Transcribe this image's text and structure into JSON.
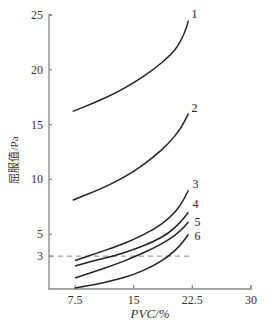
{
  "chart_data": {
    "type": "line",
    "title": "",
    "xlabel": "PVC/%",
    "ylabel": "屈服值/Pa",
    "xlim": [
      2.5,
      30
    ],
    "ylim": [
      0,
      25
    ],
    "x_ticks": [
      7.5,
      15,
      22.5,
      30
    ],
    "x_tick_labels": [
      "7.5",
      "15",
      "22.5",
      "30"
    ],
    "y_ticks": [
      3,
      5,
      10,
      15,
      20,
      25
    ],
    "y_tick_labels": [
      "3",
      "5",
      "10",
      "15",
      "20",
      "25"
    ],
    "grid": false,
    "legend": "inline curve numbers at right end of each curve",
    "reference_line": {
      "y": 3,
      "style": "dashed",
      "x_range": [
        2.5,
        22.5
      ]
    },
    "series": [
      {
        "name": "1",
        "x": [
          7.2,
          10,
          12.5,
          15,
          17.5,
          19.5,
          20.5,
          21.5,
          22.0
        ],
        "values": [
          16.2,
          17.0,
          17.8,
          18.8,
          20.0,
          21.2,
          22.0,
          23.3,
          24.5
        ]
      },
      {
        "name": "2",
        "x": [
          7.2,
          10,
          12.5,
          15,
          17.5,
          19.5,
          21.0,
          22.0
        ],
        "values": [
          8.1,
          8.9,
          9.7,
          10.7,
          12.0,
          13.3,
          14.6,
          16.0
        ]
      },
      {
        "name": "3",
        "x": [
          7.5,
          10,
          12.5,
          15,
          17.5,
          19.5,
          21.0,
          22.0
        ],
        "values": [
          2.6,
          3.2,
          3.8,
          4.5,
          5.4,
          6.4,
          7.6,
          9.0
        ]
      },
      {
        "name": "4",
        "x": [
          7.5,
          10,
          12.5,
          15,
          17.5,
          19.5,
          21.0,
          22.0
        ],
        "values": [
          2.1,
          2.6,
          3.0,
          3.6,
          4.3,
          5.1,
          6.1,
          7.0
        ]
      },
      {
        "name": "5",
        "x": [
          7.5,
          10,
          12.5,
          15,
          17.5,
          19.5,
          21.0,
          22.0
        ],
        "values": [
          1.0,
          1.6,
          2.2,
          2.9,
          3.7,
          4.5,
          5.3,
          6.1
        ]
      },
      {
        "name": "6",
        "x": [
          7.5,
          10,
          12.5,
          15,
          17.5,
          19.5,
          21.0,
          22.0
        ],
        "values": [
          0.1,
          0.4,
          0.8,
          1.3,
          2.1,
          3.0,
          4.0,
          5.0
        ]
      }
    ]
  }
}
